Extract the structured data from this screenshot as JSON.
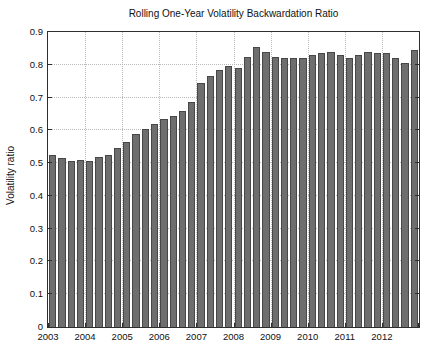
{
  "chart_data": {
    "type": "bar",
    "title": "Rolling One-Year Volatility Backwardation Ratio",
    "ylabel": "Volatility ratio",
    "xlabel": "",
    "ylim": [
      0,
      0.9
    ],
    "grid": "dotted",
    "legend": "none",
    "bar_color": "#6e6e6e",
    "bar_edge_color": "#474747",
    "x_tick_labels": [
      "2003",
      "2004",
      "2005",
      "2006",
      "2007",
      "2008",
      "2009",
      "2010",
      "2011",
      "2012"
    ],
    "y_tick_labels": [
      "0",
      "0.1",
      "0.2",
      "0.3",
      "0.4",
      "0.5",
      "0.6",
      "0.7",
      "0.8",
      "0.9"
    ],
    "categories": [
      "2003Q1",
      "2003Q2",
      "2003Q3",
      "2003Q4",
      "2004Q1",
      "2004Q2",
      "2004Q3",
      "2004Q4",
      "2005Q1",
      "2005Q2",
      "2005Q3",
      "2005Q4",
      "2006Q1",
      "2006Q2",
      "2006Q3",
      "2006Q4",
      "2007Q1",
      "2007Q2",
      "2007Q3",
      "2007Q4",
      "2008Q1",
      "2008Q2",
      "2008Q3",
      "2008Q4",
      "2009Q1",
      "2009Q2",
      "2009Q3",
      "2009Q4",
      "2010Q1",
      "2010Q2",
      "2010Q3",
      "2010Q4",
      "2011Q1",
      "2011Q2",
      "2011Q3",
      "2011Q4",
      "2012Q1",
      "2012Q2",
      "2012Q3",
      "2012Q4"
    ],
    "values": [
      0.525,
      0.515,
      0.505,
      0.51,
      0.505,
      0.52,
      0.525,
      0.545,
      0.565,
      0.59,
      0.605,
      0.62,
      0.635,
      0.645,
      0.66,
      0.685,
      0.745,
      0.765,
      0.785,
      0.795,
      0.79,
      0.825,
      0.855,
      0.84,
      0.825,
      0.82,
      0.82,
      0.82,
      0.83,
      0.835,
      0.84,
      0.83,
      0.82,
      0.83,
      0.84,
      0.835,
      0.835,
      0.82,
      0.805,
      0.845
    ]
  }
}
